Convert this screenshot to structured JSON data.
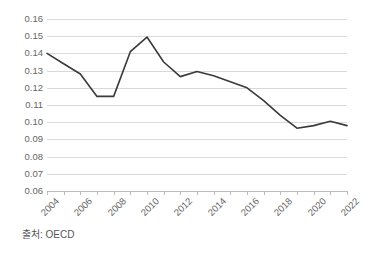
{
  "chart_data": {
    "type": "line",
    "title": "",
    "subtitle": "",
    "xlabel": "",
    "ylabel": "",
    "x": [
      2004,
      2005,
      2006,
      2007,
      2008,
      2009,
      2010,
      2011,
      2012,
      2013,
      2014,
      2015,
      2016,
      2017,
      2018,
      2019,
      2020,
      2021,
      2022
    ],
    "series": [
      {
        "name": "OECD series",
        "values": [
          0.14,
          0.134,
          0.128,
          0.115,
          0.115,
          0.141,
          0.1495,
          0.135,
          0.1265,
          0.1295,
          0.127,
          0.1235,
          0.12,
          0.1125,
          0.104,
          0.0965,
          0.098,
          0.1005,
          0.098
        ]
      }
    ],
    "xtick_labels": [
      "2004",
      "2006",
      "2008",
      "2010",
      "2012",
      "2014",
      "2016",
      "2018",
      "2020",
      "2022"
    ],
    "xtick_values": [
      2004,
      2006,
      2008,
      2010,
      2012,
      2014,
      2016,
      2018,
      2020,
      2022
    ],
    "ytick_labels": [
      "0.16",
      "0.15",
      "0.14",
      "0.13",
      "0.12",
      "0.11",
      "0.10",
      "0.09",
      "0.08",
      "0.07",
      "0.06"
    ],
    "ytick_values": [
      0.16,
      0.15,
      0.14,
      0.13,
      0.12,
      0.11,
      0.1,
      0.09,
      0.08,
      0.07,
      0.06
    ],
    "ylim": [
      0.06,
      0.16
    ],
    "xlim": [
      2004,
      2022
    ],
    "grid": "horizontal",
    "legend": "none",
    "annotations": []
  },
  "caption": {
    "source_note": "출처: OECD"
  },
  "style": {
    "line_color": "#3a3a3a",
    "grid_color": "#d9d9d9",
    "axis_color": "#bcbcbc",
    "tick_text_color": "#666666",
    "background_color": "#ffffff",
    "caption_color": "#555555"
  }
}
